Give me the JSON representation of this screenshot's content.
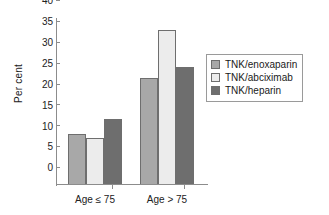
{
  "chart_data": {
    "type": "bar",
    "title": "",
    "xlabel": "",
    "ylabel": "Per cent",
    "categories": [
      "Age ≤ 75",
      "Age > 75"
    ],
    "series": [
      {
        "name": "TNK/enoxaparin",
        "values": [
          12.0,
          25.5
        ],
        "color": "#a8a8a8"
      },
      {
        "name": "TNK/abciximab",
        "values": [
          11.0,
          37.0
        ],
        "color": "#ececec"
      },
      {
        "name": "TNK/heparin",
        "values": [
          15.5,
          28.0
        ],
        "color": "#6e6e6e"
      }
    ],
    "ylim": [
      0,
      40
    ],
    "ytick_values": [
      0,
      5,
      10,
      15,
      20,
      25,
      30,
      35,
      40
    ],
    "ytick_labels": [
      "0",
      "5",
      "10",
      "15",
      "20",
      "25",
      "30",
      "35",
      "40"
    ],
    "grid": false,
    "legend_position": "right"
  },
  "legend": {
    "entries": [
      {
        "label": "TNK/enoxaparin",
        "swatch": "legend-swatch-enoxaparin"
      },
      {
        "label": "TNK/abciximab",
        "swatch": "legend-swatch-abciximab"
      },
      {
        "label": "TNK/heparin",
        "swatch": "legend-swatch-heparin"
      }
    ]
  },
  "axes": {
    "y_axis_title": "Per cent",
    "x_category_1": "Age ≤ 75",
    "x_category_2": "Age > 75"
  },
  "colors": {
    "series_1": "#a8a8a8",
    "series_2": "#ececec",
    "series_3": "#6e6e6e",
    "axis": "#8c8c8c",
    "bar_border": "#6e6e6e",
    "text": "#1a1a1a",
    "background": "#ffffff"
  }
}
